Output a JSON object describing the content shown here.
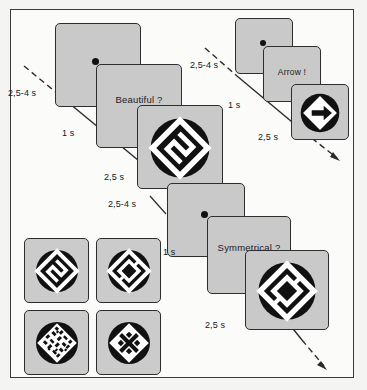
{
  "figure": {
    "background_color": "#fbfbfa",
    "panel_color": "#c9c9c9",
    "ink_color": "#1a1a1a"
  },
  "sequences": [
    {
      "name": "beautiful-sequence",
      "position": "upper-left",
      "steps": [
        {
          "name": "fixation",
          "content": "",
          "icon": "fixation-dot",
          "duration_label": "2,5-4 s"
        },
        {
          "name": "question",
          "content": "Beautiful ?",
          "icon": "",
          "duration_label": "1 s"
        },
        {
          "name": "stimulus",
          "content": "",
          "icon": "stimulus-zigzag",
          "duration_label": "2,5 s"
        }
      ]
    },
    {
      "name": "arrow-sequence",
      "position": "upper-right",
      "steps": [
        {
          "name": "fixation",
          "content": "",
          "icon": "fixation-dot",
          "duration_label": "2,5-4 s"
        },
        {
          "name": "question",
          "content": "Arrow !",
          "icon": "",
          "duration_label": "1 s"
        },
        {
          "name": "stimulus",
          "content": "",
          "icon": "stimulus-arrow",
          "duration_label": "2,5 s"
        }
      ]
    },
    {
      "name": "symmetrical-sequence",
      "position": "lower-right",
      "steps": [
        {
          "name": "fixation",
          "content": "",
          "icon": "fixation-dot",
          "duration_label": "2,5-4 s"
        },
        {
          "name": "question",
          "content": "Symmetrical ?",
          "icon": "",
          "duration_label": "1 s"
        },
        {
          "name": "stimulus",
          "content": "",
          "icon": "stimulus-symmetric",
          "duration_label": "2,5 s"
        }
      ]
    }
  ],
  "stimulus_set": {
    "name": "stimulus-examples",
    "items": [
      {
        "name": "stimulus-zigzag",
        "label": ""
      },
      {
        "name": "stimulus-symmetric",
        "label": ""
      },
      {
        "name": "stimulus-random",
        "label": ""
      },
      {
        "name": "stimulus-cross",
        "label": ""
      }
    ]
  },
  "timing_labels": {
    "seq1_fixation": "2,5-4 s",
    "seq1_question": "1 s",
    "seq1_stimulus": "2,5 s",
    "seq2_fixation": "2,5-4 s",
    "seq2_question": "1 s",
    "seq2_stimulus": "2,5 s",
    "seq3_fixation": "2,5-4 s",
    "seq3_question": "1 s",
    "seq3_stimulus": "2,5 s"
  },
  "questions": {
    "beautiful": "Beautiful ?",
    "arrow": "Arrow !",
    "symmetrical": "Symmetrical ?"
  }
}
